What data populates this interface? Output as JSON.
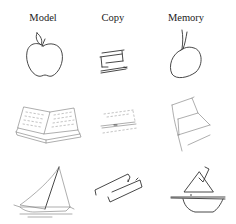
{
  "figure": {
    "columns": [
      {
        "key": "model",
        "label": "Model"
      },
      {
        "key": "copy",
        "label": "Copy"
      },
      {
        "key": "memory",
        "label": "Memory"
      }
    ],
    "rows": [
      {
        "subject": "apple",
        "model": {
          "drawing": "apple-drawing"
        },
        "copy": {
          "drawing": "apple-copy-drawing"
        },
        "memory": {
          "drawing": "apple-memory-drawing"
        }
      },
      {
        "subject": "book",
        "model": {
          "drawing": "open-book-drawing"
        },
        "copy": {
          "drawing": "book-copy-drawing"
        },
        "memory": {
          "drawing": "book-memory-drawing"
        }
      },
      {
        "subject": "sailboat",
        "model": {
          "drawing": "sailboat-drawing"
        },
        "copy": {
          "drawing": "sailboat-copy-drawing"
        },
        "memory": {
          "drawing": "sailboat-memory-drawing"
        }
      }
    ],
    "ink_color": "#333333",
    "background": "#ffffff"
  }
}
